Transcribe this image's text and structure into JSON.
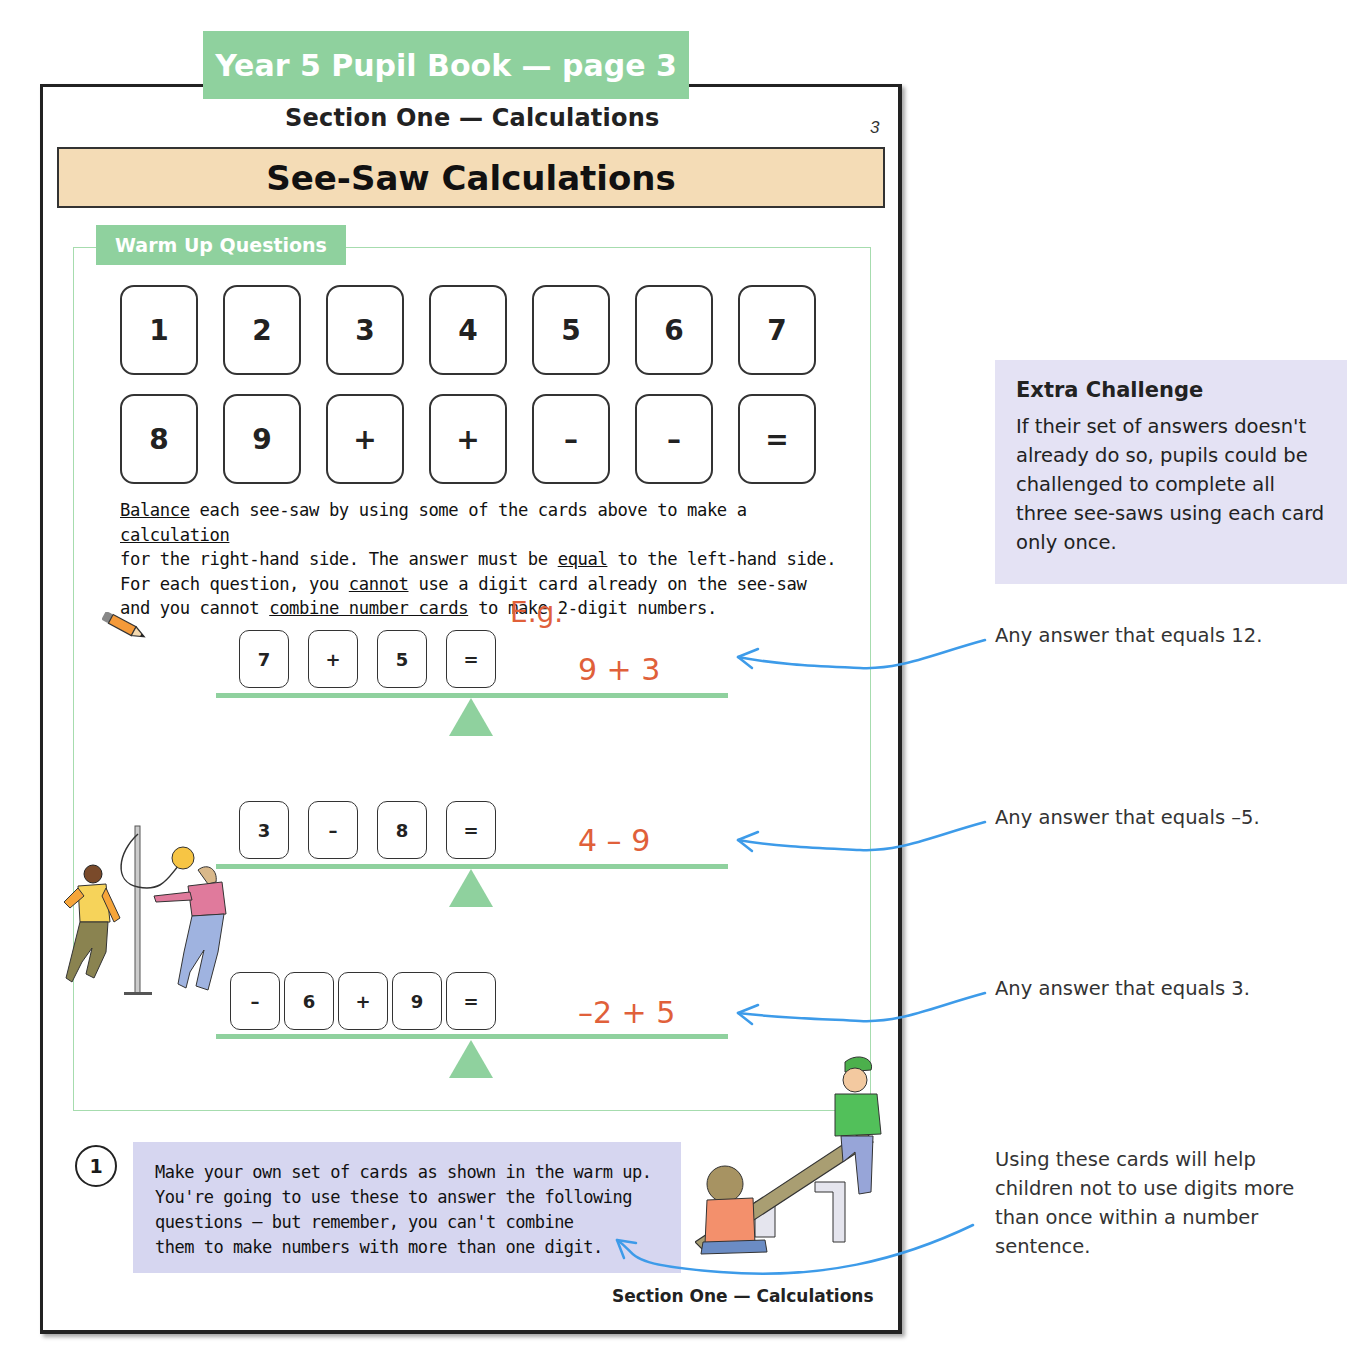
{
  "header": {
    "book_tab": "Year 5 Pupil Book — page 3",
    "section": "Section One — Calculations",
    "page_number": "3",
    "title": "See-Saw Calculations"
  },
  "warm_up": {
    "tab_label": "Warm Up Questions",
    "cards_row1": [
      "1",
      "2",
      "3",
      "4",
      "5",
      "6",
      "7"
    ],
    "cards_row2": [
      "8",
      "9",
      "+",
      "+",
      "–",
      "–",
      "="
    ],
    "instructions": {
      "line1_a": "Balance",
      "line1_b": " each see-saw by using some of the cards above to make a ",
      "line1_c": "calculation",
      "line2_a": "for the right-hand side.  The answer must be ",
      "line2_b": "equal",
      "line2_c": " to the left-hand side.",
      "line3_a": "For each question, you ",
      "line3_b": "cannot",
      "line3_c": " use a digit card already on the see-saw",
      "line4_a": "and you cannot ",
      "line4_b": "combine number cards",
      "line4_c": " to make 2-digit numbers."
    },
    "example_label": "E.g.",
    "seesaws": [
      {
        "cards": [
          "7",
          "+",
          "5",
          "="
        ],
        "answer": "9 + 3"
      },
      {
        "cards": [
          "3",
          "–",
          "8",
          "="
        ],
        "answer": "4 – 9"
      },
      {
        "cards": [
          "–",
          "6",
          "+",
          "9",
          "="
        ],
        "answer": "–2 + 5"
      }
    ]
  },
  "question": {
    "number": "1",
    "line1": "Make your own set of cards as shown in the warm up.",
    "line2": "You're going to use these to answer the following",
    "line3": "questions — but remember, you can't combine",
    "line4": "them to make numbers with more than one digit."
  },
  "footer": "Section One — Calculations",
  "margin_notes": {
    "extra_challenge_title": "Extra Challenge",
    "extra_challenge_text": "If their set of answers doesn't already do so, pupils could be challenged to complete all three see-saws using each card only once.",
    "note1": "Any answer that equals 12.",
    "note2": "Any answer that equals –5.",
    "note3": "Any answer that equals 3.",
    "note4": "Using these cards will help children not to use digits more than once within a number sentence."
  },
  "colors": {
    "green": "#8fd19e",
    "title_band": "#f4dcb6",
    "answer_red": "#e0603a",
    "arrow_blue": "#3d9be9",
    "question_box": "#d6d6f0",
    "challenge_box": "#e4e2f4"
  }
}
